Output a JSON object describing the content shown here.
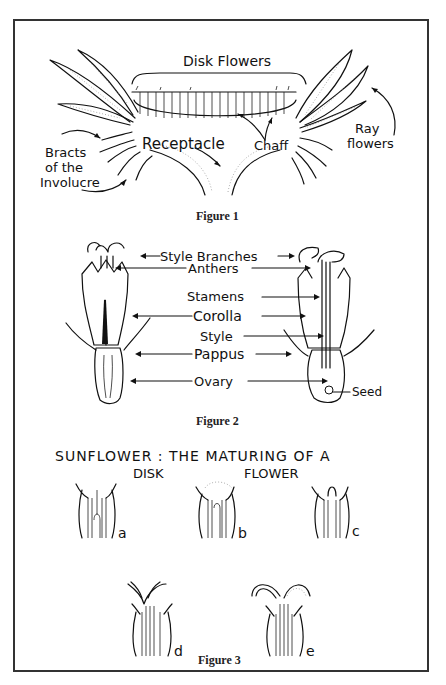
{
  "figure1": {
    "caption": "Figure 1",
    "labels": {
      "disk_flowers": "Disk Flowers",
      "receptacle": "Receptacle",
      "chaff": "Chaff",
      "ray_line1": "Ray",
      "ray_line2": "flowers",
      "bracts_line1": "Bracts",
      "bracts_line2": "of the",
      "bracts_line3": "Involucre"
    }
  },
  "figure2": {
    "caption": "Figure 2",
    "labels": {
      "style_branches": "Style Branches",
      "anthers": "Anthers",
      "stamens": "Stamens",
      "corolla": "Corolla",
      "style": "Style",
      "pappus": "Pappus",
      "ovary": "Ovary",
      "seed": "Seed"
    }
  },
  "figure3": {
    "caption": "Figure 3",
    "title_line1": "SUNFLOWER : THE MATURING OF A",
    "title_line2_left": "DISK",
    "title_line2_right": "FLOWER",
    "stages": [
      "a",
      "b",
      "c",
      "d",
      "e"
    ]
  },
  "footer_cut_text": ""
}
